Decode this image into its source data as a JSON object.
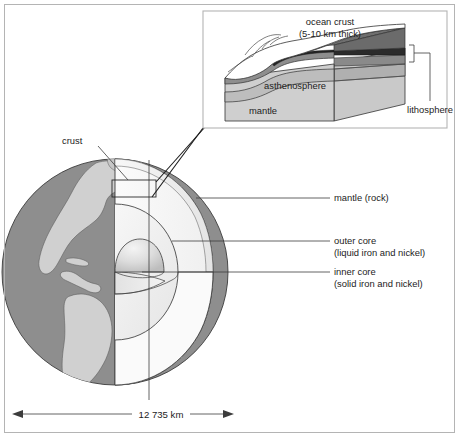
{
  "figure": {
    "border_color": "#b4b4b4",
    "background": "#ffffff"
  },
  "globe": {
    "ocean_color": "#8e8e8e",
    "land_color": "#d0d0d0",
    "cutaway_mantle_color": "#f2f2f2",
    "outer_core_color": "#ededed",
    "inner_core_color": "#d8d8d8",
    "outline_color": "#3c3c3c"
  },
  "labels": {
    "crust": "crust",
    "mantle": "mantle (rock)",
    "outer_core_line1": "outer core",
    "outer_core_line2": "(liquid iron and nickel)",
    "inner_core_line1": "inner core",
    "inner_core_line2": "(solid iron and nickel)"
  },
  "scale": {
    "value": "12 735 km"
  },
  "inset": {
    "ocean_crust_line1": "ocean crust",
    "ocean_crust_line2": "(5-10 km thick)",
    "asthenosphere": "asthenosphere",
    "mantle": "mantle",
    "lithosphere": "lithosphere",
    "crust_color": "#2b2b2b",
    "upper_mantle_color": "#6f6f6f",
    "asthenosphere_color": "#b9b9b9",
    "mantle_color": "#cfcfcf",
    "seafloor_color": "#ffffff"
  }
}
